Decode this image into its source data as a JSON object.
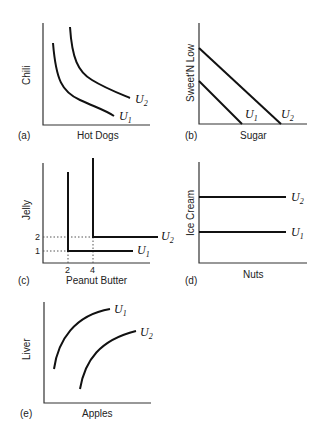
{
  "panels": [
    {
      "id": "a",
      "tag": "(a)",
      "xlabel": "Hot Dogs",
      "ylabel": "Chili",
      "curves": [
        {
          "name": "U",
          "sub": "1"
        },
        {
          "name": "U",
          "sub": "2"
        }
      ]
    },
    {
      "id": "b",
      "tag": "(b)",
      "xlabel": "Sugar",
      "ylabel": "Sweet'N Low",
      "curves": [
        {
          "name": "U",
          "sub": "1"
        },
        {
          "name": "U",
          "sub": "2"
        }
      ]
    },
    {
      "id": "c",
      "tag": "(c)",
      "xlabel": "Peanut Butter",
      "ylabel": "Jelly",
      "curves": [
        {
          "name": "U",
          "sub": "1"
        },
        {
          "name": "U",
          "sub": "2"
        }
      ],
      "xticks": [
        "2",
        "4"
      ],
      "yticks": [
        "1",
        "2"
      ]
    },
    {
      "id": "d",
      "tag": "(d)",
      "xlabel": "Nuts",
      "ylabel": "Ice Cream",
      "curves": [
        {
          "name": "U",
          "sub": "1"
        },
        {
          "name": "U",
          "sub": "2"
        }
      ]
    },
    {
      "id": "e",
      "tag": "(e)",
      "xlabel": "Apples",
      "ylabel": "Liver",
      "curves": [
        {
          "name": "U",
          "sub": "1"
        },
        {
          "name": "U",
          "sub": "2"
        }
      ]
    }
  ]
}
